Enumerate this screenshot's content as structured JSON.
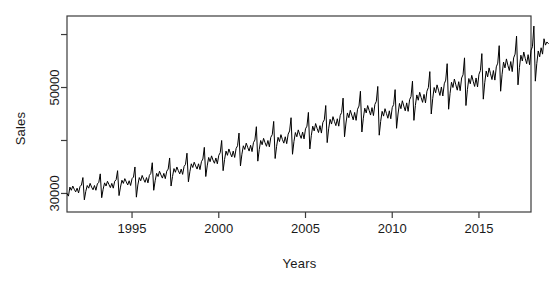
{
  "chart_data": {
    "type": "line",
    "title": "",
    "xlabel": "Years",
    "ylabel": "Sales",
    "xlim": [
      1991.3,
      1018.0
    ],
    "x_axis": {
      "min": 1991.25,
      "max": 2018.0,
      "tick_values": [
        1995,
        2000,
        2005,
        2010,
        2015
      ],
      "tick_labels": [
        "1995",
        "2000",
        "2005",
        "2010",
        "2015"
      ]
    },
    "y_axis": {
      "min": 26500,
      "max": 63500,
      "tick_values": [
        30000,
        40000,
        50000,
        60000
      ],
      "tick_labels": [
        "30000",
        "",
        "50000",
        ""
      ],
      "labeled_ticks": [
        "30000",
        "50000"
      ]
    },
    "grid": false,
    "legend": null,
    "line_color": "#000000",
    "background_color": "#ffffff",
    "series": [
      {
        "name": "Sales",
        "frequency": "monthly",
        "start": 1991.25,
        "notes": "Monthly retail sales with upward trend and strong December seasonal spike",
        "values": [
          30000,
          29500,
          31200,
          30600,
          31400,
          30800,
          30300,
          31000,
          30100,
          31300,
          31600,
          33000,
          28800,
          30400,
          31500,
          31000,
          31900,
          31200,
          30700,
          31500,
          30600,
          31800,
          32100,
          33700,
          29200,
          30800,
          32000,
          31400,
          32300,
          31700,
          31100,
          31900,
          31000,
          32300,
          32600,
          34300,
          29600,
          31200,
          32500,
          31900,
          32800,
          32200,
          31600,
          32400,
          31500,
          32800,
          33100,
          35000,
          29300,
          31600,
          33000,
          32400,
          33400,
          32700,
          32100,
          33000,
          32000,
          33400,
          33800,
          35800,
          30600,
          32400,
          33800,
          33200,
          34200,
          33500,
          32900,
          33800,
          32800,
          34200,
          34600,
          36700,
          31400,
          33200,
          34700,
          34000,
          35000,
          34300,
          33700,
          34600,
          33600,
          35100,
          35500,
          37600,
          32200,
          34100,
          35600,
          34900,
          35900,
          35200,
          34600,
          35600,
          34500,
          36000,
          36500,
          38700,
          33200,
          35200,
          36800,
          36000,
          37100,
          36300,
          35700,
          36700,
          35600,
          37200,
          37700,
          40000,
          34300,
          36400,
          38000,
          37200,
          38400,
          37600,
          36900,
          38000,
          36800,
          38500,
          39000,
          41400,
          35200,
          37400,
          39000,
          38300,
          39500,
          38700,
          38000,
          39100,
          37900,
          39600,
          40100,
          42600,
          36100,
          38300,
          40000,
          39200,
          40400,
          39600,
          38900,
          40000,
          38800,
          40600,
          41100,
          43600,
          36600,
          38900,
          40600,
          39800,
          41100,
          40200,
          39500,
          40700,
          39400,
          41200,
          41800,
          44300,
          37400,
          39800,
          41500,
          40700,
          42000,
          41100,
          40400,
          41600,
          40300,
          42200,
          42700,
          45300,
          38400,
          40900,
          42700,
          41800,
          43200,
          42300,
          41500,
          42800,
          41400,
          43400,
          43900,
          46600,
          39600,
          42200,
          44000,
          43100,
          44500,
          43600,
          42800,
          44100,
          42700,
          44700,
          45300,
          48000,
          40700,
          43300,
          45200,
          44300,
          45700,
          44800,
          43900,
          45300,
          43800,
          45900,
          46500,
          49300,
          41600,
          44200,
          46100,
          45200,
          46600,
          45700,
          44800,
          46200,
          44700,
          46800,
          47400,
          50200,
          41000,
          43600,
          45500,
          44600,
          46000,
          45100,
          44200,
          45600,
          44100,
          46200,
          46800,
          49600,
          42300,
          45000,
          47000,
          46000,
          47500,
          46500,
          45600,
          47100,
          45500,
          47700,
          48300,
          51200,
          43800,
          46600,
          48600,
          47600,
          49100,
          48100,
          47200,
          48700,
          47100,
          49300,
          50000,
          53000,
          45000,
          47900,
          50000,
          49000,
          50500,
          49500,
          48500,
          50100,
          48400,
          50700,
          51400,
          54500,
          45900,
          48900,
          51000,
          50000,
          51600,
          50500,
          49500,
          51100,
          49400,
          51800,
          52400,
          55600,
          46600,
          49600,
          51700,
          50700,
          52300,
          51200,
          50200,
          51800,
          50100,
          52500,
          53200,
          56400,
          47800,
          50900,
          53100,
          52000,
          53700,
          52600,
          51500,
          53200,
          51400,
          53900,
          54600,
          57900,
          49300,
          52500,
          54800,
          53700,
          55400,
          54200,
          53200,
          54900,
          53000,
          55600,
          56300,
          59700,
          50500,
          53800,
          56100,
          55000,
          56700,
          55500,
          54500,
          56200,
          54300,
          57000,
          57700,
          61600,
          51200,
          54500,
          56900,
          55800,
          57500,
          56300,
          59200,
          58000,
          58600,
          58300
        ]
      }
    ]
  },
  "axis_labels": {
    "x_title": "Years",
    "y_title": "Sales"
  }
}
